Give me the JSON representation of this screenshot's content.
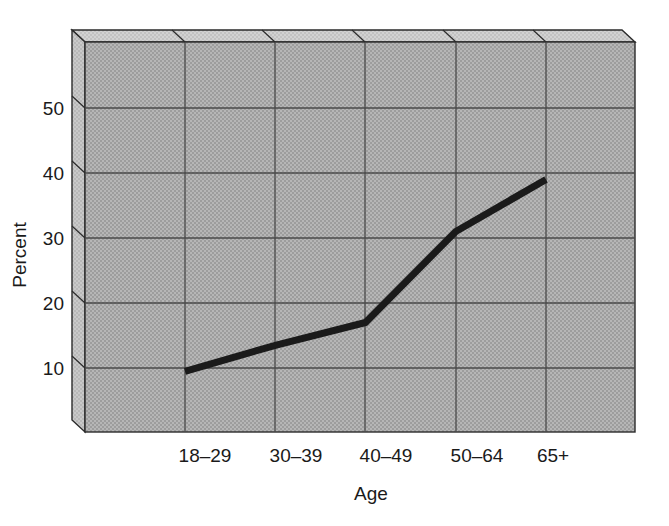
{
  "chart_data": {
    "type": "line",
    "title": "",
    "subtitle": "",
    "xlabel": "Age",
    "ylabel": "Percent",
    "categories": [
      "18–29",
      "30–39",
      "40–49",
      "50–64",
      "65+"
    ],
    "values": [
      9.5,
      13.5,
      17,
      31,
      39
    ],
    "series": [
      {
        "name": "Percent",
        "values": [
          9.5,
          13.5,
          17,
          31,
          39
        ]
      }
    ],
    "ylim": [
      0,
      58
    ],
    "yticks": [
      10,
      20,
      30,
      40,
      50
    ],
    "ytick_labels": [
      "10",
      "20",
      "30",
      "40",
      "50"
    ],
    "grid": true,
    "legend": false,
    "legend_position": "none",
    "annotations": [],
    "style": {
      "plot_background": "#ababab",
      "plot_background_pattern": "halftone-dots",
      "bevel_top": "#c8c8c8",
      "bevel_left": "#bdbdbd",
      "grid_color": "#4a4a4a",
      "border_color": "#2b2b2b",
      "line_color": "#1a1a1a",
      "line_width": 7,
      "page_background": "#ffffff"
    }
  },
  "axes": {
    "y_axis_title": "Percent",
    "x_axis_title": "Age",
    "y_tick_labels": [
      "50",
      "40",
      "30",
      "20",
      "10"
    ],
    "x_tick_labels": [
      "18–29",
      "30–39",
      "40–49",
      "50–64",
      "65+"
    ]
  }
}
